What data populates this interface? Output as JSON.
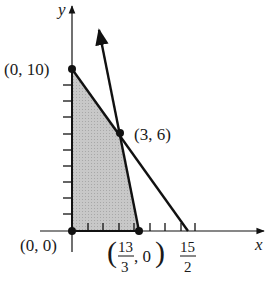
{
  "diagram": {
    "type": "linear-programming feasible region",
    "axes": {
      "x_label": "x",
      "y_label": "y"
    },
    "colors": {
      "shade": "#c4c4c4",
      "line": "#111111",
      "background": "#ffffff"
    },
    "vertices": [
      {
        "label": "(0, 10)",
        "x": 0,
        "y": 10
      },
      {
        "label": "(3, 6)",
        "x": 3,
        "y": 6
      },
      {
        "label": "(0, 0)",
        "x": 0,
        "y": 0
      }
    ],
    "vertex_frac": {
      "open": "(",
      "num": "13",
      "den": "3",
      "rest": ", 0",
      "close": ")"
    },
    "x_intercept_frac": {
      "num": "15",
      "den": "2"
    },
    "lines": [
      {
        "name": "line through (0,10) and (15/2,0)"
      },
      {
        "name": "line through (13/3,0) and (3,6), arrow upward"
      }
    ]
  }
}
